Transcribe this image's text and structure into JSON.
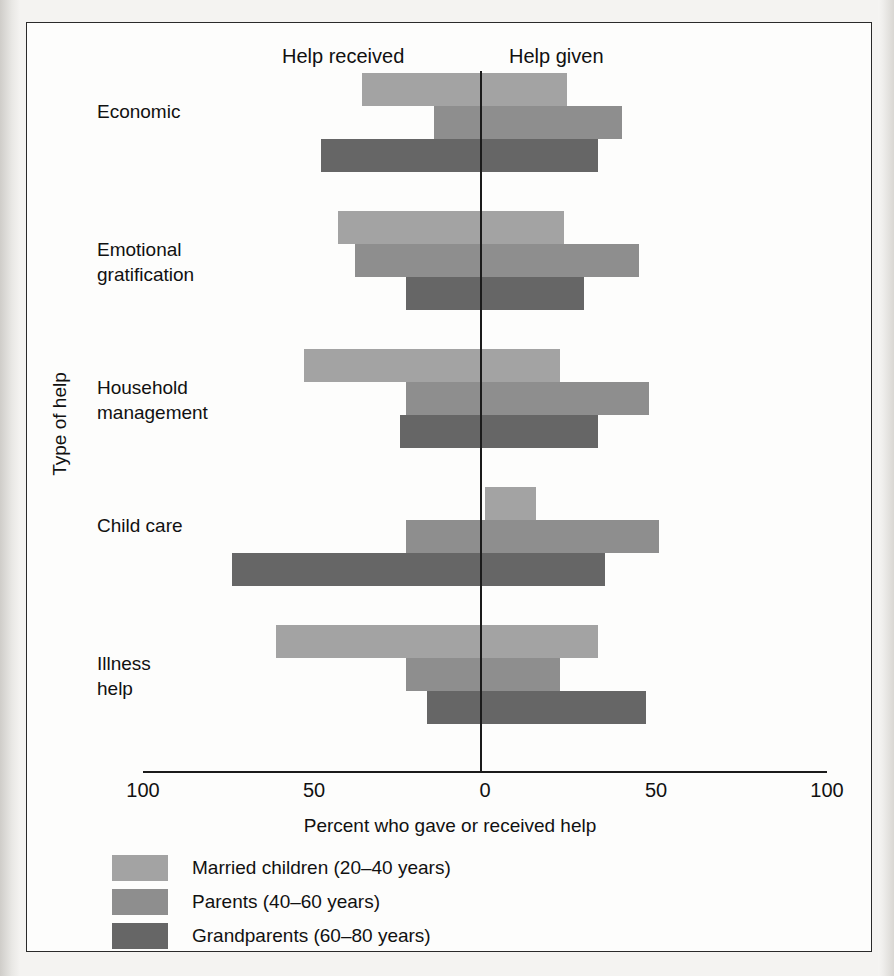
{
  "figure": {
    "direction_left_label": "Help received",
    "direction_right_label": "Help given",
    "x_axis_title": "Percent who gave or received help",
    "y_axis_title": "Type of help"
  },
  "chart_data": {
    "type": "bar",
    "orientation": "horizontal-diverging",
    "title": "",
    "xlabel": "Percent who gave or received help",
    "ylabel": "Type of help",
    "xlim": [
      -100,
      100
    ],
    "xticks": [
      -100,
      -50,
      0,
      50,
      100
    ],
    "xtick_labels": [
      "100",
      "50",
      "0",
      "50",
      "100"
    ],
    "grid": false,
    "legend_position": "below-axes",
    "direction_labels": {
      "negative": "Help received",
      "positive": "Help given"
    },
    "categories": [
      "Economic",
      "Emotional\ngratification",
      "Household\nmanagement",
      "Child care",
      "Illness\nhelp"
    ],
    "series": [
      {
        "name": "Married children (20–40 years)",
        "color": "#a3a3a3",
        "received": [
          36,
          43,
          53,
          0,
          61
        ],
        "given": [
          24,
          23,
          22,
          15,
          33
        ]
      },
      {
        "name": "Parents (40–60 years)",
        "color": "#8e8e8e",
        "received": [
          15,
          38,
          23,
          23,
          23
        ],
        "given": [
          40,
          45,
          48,
          51,
          22
        ]
      },
      {
        "name": "Grandparents (60–80 years)",
        "color": "#666666",
        "received": [
          48,
          23,
          25,
          74,
          17
        ],
        "given": [
          33,
          29,
          33,
          35,
          47
        ]
      }
    ]
  },
  "legend": {
    "items": [
      {
        "label": "Married children (20–40 years)",
        "color": "#a3a3a3"
      },
      {
        "label": "Parents (40–60 years)",
        "color": "#8e8e8e"
      },
      {
        "label": "Grandparents (60–80 years)",
        "color": "#666666"
      }
    ]
  }
}
